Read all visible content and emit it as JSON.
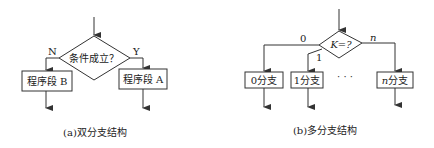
{
  "diagram_a": {
    "condition": "条件成立？",
    "no_label": "N",
    "yes_label": "Y",
    "branch_b": "程序段 B",
    "branch_a": "程序段 A",
    "caption": "(a)双分支结构"
  },
  "diagram_b": {
    "condition": "K=?",
    "label_0": "0",
    "label_1": "1",
    "label_n": "n",
    "branch_0": "0分支",
    "branch_1": "1分支",
    "ellipsis": "· · ·",
    "branch_n_var": "n",
    "branch_n_text": "分支",
    "caption": "(b)多分支结构"
  },
  "colors": {
    "stroke": "#333333",
    "text": "#222222",
    "background": "#ffffff"
  }
}
